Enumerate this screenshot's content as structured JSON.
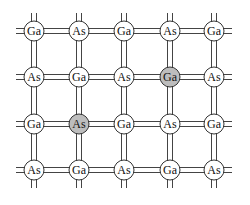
{
  "diagram": {
    "colors": {
      "bond": "#444444",
      "atom_fill": "#ffffff",
      "atom_shaded": "#bdbdbd",
      "atom_stroke": "#333333"
    },
    "columns_x": [
      34,
      79,
      124,
      170,
      214
    ],
    "rows_y": [
      31,
      77,
      124,
      170
    ],
    "atom_radius": 10,
    "rows": [
      [
        {
          "label": "Ga",
          "shaded": false
        },
        {
          "label": "As",
          "shaded": false
        },
        {
          "label": "Ga",
          "shaded": false
        },
        {
          "label": "As",
          "shaded": false
        },
        {
          "label": "Ga",
          "shaded": false
        }
      ],
      [
        {
          "label": "As",
          "shaded": false
        },
        {
          "label": "Ga",
          "shaded": false
        },
        {
          "label": "As",
          "shaded": false
        },
        {
          "label": "Ga",
          "shaded": true
        },
        {
          "label": "As",
          "shaded": false
        }
      ],
      [
        {
          "label": "Ga",
          "shaded": false
        },
        {
          "label": "As",
          "shaded": true
        },
        {
          "label": "Ga",
          "shaded": false
        },
        {
          "label": "As",
          "shaded": false
        },
        {
          "label": "Ga",
          "shaded": false
        }
      ],
      [
        {
          "label": "As",
          "shaded": false
        },
        {
          "label": "Ga",
          "shaded": false
        },
        {
          "label": "As",
          "shaded": false
        },
        {
          "label": "Ga",
          "shaded": false
        },
        {
          "label": "As",
          "shaded": false
        }
      ]
    ]
  }
}
